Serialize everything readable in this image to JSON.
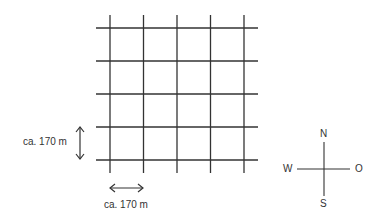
{
  "diagram": {
    "type": "street-grid",
    "grid": {
      "vertical_lines": 5,
      "horizontal_lines": 5,
      "line_color": "#333333"
    },
    "scale": {
      "vertical_label": "ca. 170 m",
      "horizontal_label": "ca. 170 m"
    },
    "compass": {
      "north": "N",
      "south": "S",
      "west": "W",
      "east": "O"
    }
  }
}
